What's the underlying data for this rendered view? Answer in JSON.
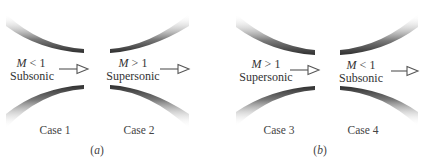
{
  "figure": {
    "panels": [
      {
        "id": "a",
        "label_open": "(",
        "label_letter": "a",
        "label_close": ")",
        "cases": [
          {
            "name": "Case 1",
            "mach_symbol": "M",
            "mach_relation": " < 1",
            "regime": "Subsonic",
            "geometry": "converging"
          },
          {
            "name": "Case 2",
            "mach_symbol": "M",
            "mach_relation": " > 1",
            "regime": "Supersonic",
            "geometry": "diverging"
          }
        ]
      },
      {
        "id": "b",
        "label_open": "(",
        "label_letter": "b",
        "label_close": ")",
        "cases": [
          {
            "name": "Case 3",
            "mach_symbol": "M",
            "mach_relation": " > 1",
            "regime": "Supersonic",
            "geometry": "converging"
          },
          {
            "name": "Case 4",
            "mach_symbol": "M",
            "mach_relation": " < 1",
            "regime": "Subsonic",
            "geometry": "diverging"
          }
        ]
      }
    ],
    "icons": {
      "flow_arrow": "hollow-triangle-arrow-right"
    },
    "colors": {
      "wall_dark": "#3a3a3a",
      "wall_light": "#ffffff",
      "text": "#333333"
    }
  }
}
